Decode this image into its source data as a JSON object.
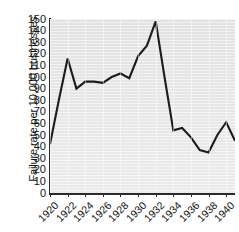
{
  "chart_data": {
    "type": "line",
    "title": "",
    "subtitle": "",
    "xlabel": "",
    "ylabel": "Failure rate per 10,000 businesses",
    "xlim": [
      1920,
      1941
    ],
    "ylim": [
      0,
      150
    ],
    "grid": false,
    "legend": null,
    "annotations": [],
    "ytick_labels": [
      "150",
      "140",
      "130",
      "120",
      "110",
      "100",
      "90",
      "80",
      "70",
      "60",
      "50",
      "40",
      "30",
      "20",
      "10",
      "0"
    ],
    "ytick_values": [
      150,
      140,
      130,
      120,
      110,
      100,
      90,
      80,
      70,
      60,
      50,
      40,
      30,
      20,
      10,
      0
    ],
    "xtick_labels": [
      "1920",
      "1922",
      "1924",
      "1926",
      "1928",
      "1930",
      "1932",
      "1934",
      "1936",
      "1938",
      "1940"
    ],
    "xtick_values": [
      1920,
      1922,
      1924,
      1926,
      1928,
      1930,
      1932,
      1934,
      1936,
      1938,
      1940
    ],
    "x": [
      1920,
      1921,
      1922,
      1923,
      1924,
      1925,
      1926,
      1927,
      1928,
      1929,
      1930,
      1931,
      1932,
      1933,
      1934,
      1935,
      1936,
      1937,
      1938,
      1939,
      1940,
      1941
    ],
    "values": [
      42,
      80,
      116,
      90,
      96,
      96,
      95,
      100,
      103,
      99,
      118,
      127,
      148,
      100,
      54,
      56,
      48,
      37,
      35,
      50,
      61,
      45
    ],
    "series": [
      {
        "name": "Failure rate per 10,000 businesses",
        "color": "#1c1c1c",
        "values": [
          42,
          80,
          116,
          90,
          96,
          96,
          95,
          100,
          103,
          99,
          118,
          127,
          148,
          100,
          54,
          56,
          48,
          37,
          35,
          50,
          61,
          45
        ]
      }
    ]
  },
  "plot_style": {
    "background": "#e6e6e6",
    "line_color": "#1c1c1c",
    "axis_color": "#2b2b2b",
    "text_color": "#111111"
  }
}
